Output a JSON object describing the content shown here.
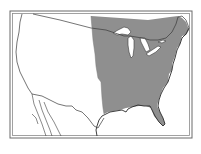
{
  "map": {
    "type": "outline map",
    "subject": "Continental United States with eastern region shaded",
    "shaded_region": "eastern United States (east of the Great Plains, including Great Lakes region and Florida)",
    "colors": {
      "background": "#ffffff",
      "shaded": "#8f8f8f",
      "outline": "#3a3a3a",
      "lakes": "#ffffff",
      "frame": "#6a6a6a"
    },
    "labels": []
  }
}
